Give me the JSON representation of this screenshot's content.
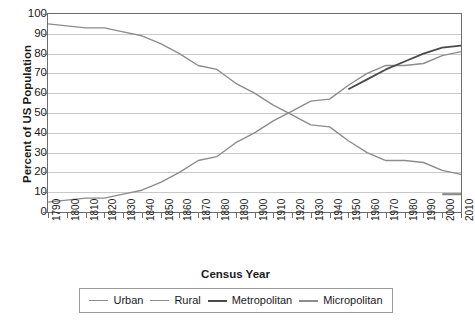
{
  "chart_data": {
    "type": "line",
    "title": "",
    "xlabel": "Census Year",
    "ylabel": "Percent of US Population",
    "xlim": [
      1790,
      2010
    ],
    "ylim": [
      0,
      100
    ],
    "ytick_step": 10,
    "grid": true,
    "legend_position": "bottom",
    "x": [
      1790,
      1800,
      1810,
      1820,
      1830,
      1840,
      1850,
      1860,
      1870,
      1880,
      1890,
      1900,
      1910,
      1920,
      1930,
      1940,
      1950,
      1960,
      1970,
      1980,
      1990,
      2000,
      2010
    ],
    "yticks": [
      0,
      10,
      20,
      30,
      40,
      50,
      60,
      70,
      80,
      90,
      100
    ],
    "xticklabels": [
      "1790",
      "1800",
      "1810",
      "1820",
      "1830",
      "1840",
      "1850",
      "1860",
      "1870",
      "1880",
      "1890",
      "1900",
      "1910",
      "1920",
      "1930",
      "1940",
      "1950",
      "1960",
      "1970",
      "1980",
      "1990",
      "2000",
      "2010"
    ],
    "series": [
      {
        "name": "Urban",
        "color": "#8c8c8c",
        "width": 1.4,
        "x": [
          1790,
          1800,
          1810,
          1820,
          1830,
          1840,
          1850,
          1860,
          1870,
          1880,
          1890,
          1900,
          1910,
          1920,
          1930,
          1940,
          1950,
          1960,
          1970,
          1980,
          1990,
          2000,
          2010
        ],
        "values": [
          5,
          6,
          7,
          7,
          9,
          11,
          15,
          20,
          26,
          28,
          35,
          40,
          46,
          51,
          56,
          57,
          64,
          70,
          74,
          74,
          75,
          79,
          81
        ]
      },
      {
        "name": "Rural",
        "color": "#8c8c8c",
        "width": 1.4,
        "x": [
          1790,
          1800,
          1810,
          1820,
          1830,
          1840,
          1850,
          1860,
          1870,
          1880,
          1890,
          1900,
          1910,
          1920,
          1930,
          1940,
          1950,
          1960,
          1970,
          1980,
          1990,
          2000,
          2010
        ],
        "values": [
          95,
          94,
          93,
          93,
          91,
          89,
          85,
          80,
          74,
          72,
          65,
          60,
          54,
          49,
          44,
          43,
          36,
          30,
          26,
          26,
          25,
          21,
          19
        ]
      },
      {
        "name": "Metropolitan",
        "color": "#4a4a4a",
        "width": 1.8,
        "x": [
          1950,
          1960,
          1970,
          1980,
          1990,
          2000,
          2010
        ],
        "values": [
          62,
          67,
          72,
          76,
          80,
          83,
          84
        ]
      },
      {
        "name": "Micropolitan",
        "color": "#8c8c8c",
        "width": 2.2,
        "x": [
          2000,
          2010
        ],
        "values": [
          9,
          9
        ]
      }
    ]
  },
  "legend": {
    "items": [
      {
        "label": "Urban"
      },
      {
        "label": "Rural"
      },
      {
        "label": "Metropolitan"
      },
      {
        "label": "Micropolitan"
      }
    ]
  }
}
